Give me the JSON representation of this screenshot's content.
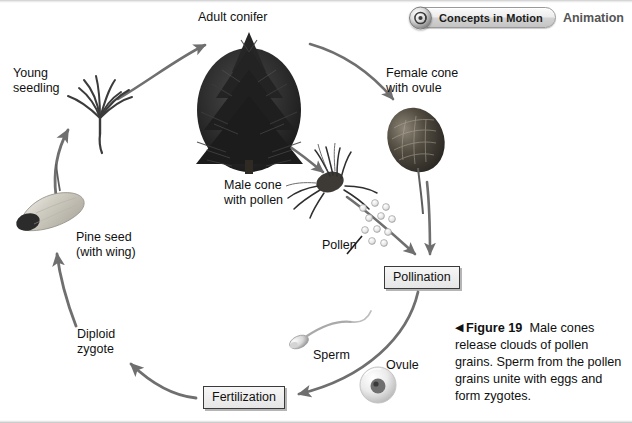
{
  "figure": {
    "title_prefix": "Figure 19",
    "caption_body": "Male cones release clouds of pollen grains. Sperm from the pollen grains unite with eggs and form zygotes.",
    "caption_marker": "◀"
  },
  "badge": {
    "pill_label": "Concepts in Motion",
    "link_label": "Animation",
    "icon_name": "motion-circle-icon"
  },
  "diagram": {
    "type": "life-cycle",
    "labels": [
      {
        "id": "adult-conifer",
        "text": "Adult conifer",
        "x": 198,
        "y": 10,
        "align": "left"
      },
      {
        "id": "young-seedling",
        "text": "Young\nseedling",
        "x": 13,
        "y": 66,
        "align": "left"
      },
      {
        "id": "female-cone",
        "text": "Female cone\nwith ovule",
        "x": 386,
        "y": 66,
        "align": "left"
      },
      {
        "id": "male-cone",
        "text": "Male cone\nwith pollen",
        "x": 224,
        "y": 178,
        "align": "left"
      },
      {
        "id": "pollen",
        "text": "Pollen",
        "x": 322,
        "y": 238,
        "align": "left"
      },
      {
        "id": "pine-seed",
        "text": "Pine seed\n(with wing)",
        "x": 76,
        "y": 230,
        "align": "left"
      },
      {
        "id": "diploid-zygote",
        "text": "Diploid\nzygote",
        "x": 77,
        "y": 327,
        "align": "left"
      },
      {
        "id": "sperm",
        "text": "Sperm",
        "x": 313,
        "y": 348,
        "align": "left"
      },
      {
        "id": "ovule",
        "text": "Ovule",
        "x": 386,
        "y": 358,
        "align": "left"
      }
    ],
    "process_boxes": [
      {
        "id": "pollination",
        "text": "Pollination",
        "x": 384,
        "y": 266
      },
      {
        "id": "fertilization",
        "text": "Fertilization",
        "x": 203,
        "y": 386
      }
    ],
    "stages_order": [
      "Adult conifer",
      "Female cone with ovule",
      "Pollination",
      "Fertilization",
      "Diploid zygote",
      "Pine seed (with wing)",
      "Young seedling"
    ],
    "colors": {
      "arrow": "#6f6f6f",
      "text": "#111111",
      "box_border": "#3a3a3a",
      "box_fill": "#eeeeee",
      "photo_dark": "#2b2b2b"
    }
  }
}
